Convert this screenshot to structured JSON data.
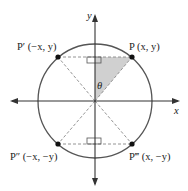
{
  "diagram": {
    "axes": {
      "x_label": "x",
      "y_label": "y"
    },
    "angle_label": "θ",
    "points": [
      {
        "name": "P",
        "label": "P (x, y)",
        "quadrant": "I"
      },
      {
        "name": "P'",
        "label": "P′ (−x, y)",
        "quadrant": "II"
      },
      {
        "name": "P''",
        "label": "P″ (−x, −y)",
        "quadrant": "III"
      },
      {
        "name": "P'''",
        "label": "P‴ (x, −y)",
        "quadrant": "IV"
      }
    ],
    "colors": {
      "circle": "#555555",
      "shade": "#c8c8c8",
      "dashed": "#888888"
    }
  }
}
